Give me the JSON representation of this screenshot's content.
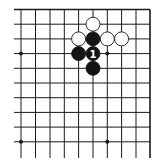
{
  "diagram": {
    "type": "go-board-fragment",
    "corner": "top-right",
    "columns": 10,
    "rows": 10,
    "grid_x": [
      21,
      35.5,
      50,
      64.3,
      78.6,
      93,
      107.3,
      121.6,
      136,
      150
    ],
    "grid_y": [
      9.5,
      24.2,
      38.9,
      53.6,
      68.3,
      83,
      97.7,
      112.4,
      127.1,
      141.8
    ],
    "left_extent": 14,
    "bottom_extent": 158,
    "stone_radius": 7,
    "colors": {
      "line": "#1a1a1a",
      "black_stone": "#141414",
      "white_stone": "#ffffff",
      "background": "#ffffff"
    },
    "star_points": [
      {
        "col": 0,
        "row": 3
      },
      {
        "col": 6,
        "row": 3
      },
      {
        "col": 0,
        "row": 9
      },
      {
        "col": 6,
        "row": 9
      }
    ],
    "stones": [
      {
        "color": "white",
        "col": 5,
        "row": 1,
        "label": ""
      },
      {
        "color": "white",
        "col": 4,
        "row": 2,
        "label": ""
      },
      {
        "color": "black",
        "col": 5,
        "row": 2,
        "label": ""
      },
      {
        "color": "white",
        "col": 6,
        "row": 2,
        "label": ""
      },
      {
        "color": "white",
        "col": 7,
        "row": 2,
        "label": ""
      },
      {
        "color": "black",
        "col": 4,
        "row": 3,
        "label": ""
      },
      {
        "color": "black",
        "col": 5,
        "row": 3,
        "label": "1"
      },
      {
        "color": "black",
        "col": 5,
        "row": 4,
        "label": ""
      }
    ]
  }
}
